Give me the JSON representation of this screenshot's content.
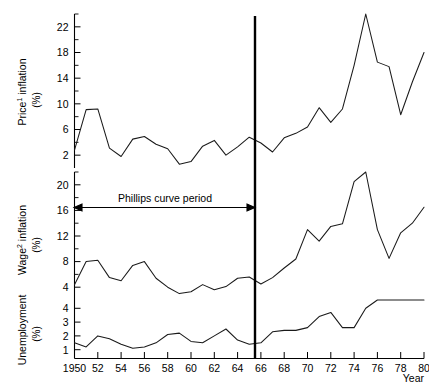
{
  "chart_data": {
    "type": "line",
    "title": "",
    "xlabel": "Year",
    "x": [
      1950,
      1951,
      1952,
      1953,
      1954,
      1955,
      1956,
      1957,
      1958,
      1959,
      1960,
      1961,
      1962,
      1963,
      1964,
      1965,
      1966,
      1967,
      1968,
      1969,
      1970,
      1971,
      1972,
      1973,
      1974,
      1975,
      1976,
      1977,
      1978,
      1979,
      1980
    ],
    "xtick_labels": [
      "1950",
      "52",
      "54",
      "56",
      "58",
      "60",
      "62",
      "64",
      "66",
      "68",
      "70",
      "72",
      "74",
      "76",
      "78",
      "80"
    ],
    "xtick_values": [
      1950,
      1952,
      1954,
      1956,
      1958,
      1960,
      1962,
      1964,
      1966,
      1968,
      1970,
      1972,
      1974,
      1976,
      1978,
      1980
    ],
    "grid": false,
    "legend": "none",
    "annotations": [
      {
        "text": "Phillips curve period",
        "type": "double-arrow-span",
        "x_start": 1950,
        "x_end": 1966,
        "panel": "wage"
      },
      {
        "text": "",
        "type": "vertical-divider",
        "x": 1966,
        "panel": "all"
      }
    ],
    "panels": [
      {
        "key": "price",
        "name": "Price inflation",
        "ylabel": "Price¹ inflation (%)",
        "ylabel_main": "Price",
        "ylabel_sup": "1",
        "ylabel_rest": " inflation",
        "ylabel_unit": "(%)",
        "ylim": [
          0,
          24
        ],
        "yticks": [
          2,
          6,
          10,
          14,
          18,
          22
        ],
        "ytick_minor": [
          4,
          8,
          12,
          16,
          20,
          24
        ],
        "values": [
          2.8,
          9.1,
          9.2,
          3.1,
          1.8,
          4.5,
          4.9,
          3.7,
          3.0,
          0.6,
          1.0,
          3.4,
          4.3,
          2.0,
          3.3,
          4.8,
          3.9,
          2.5,
          4.7,
          5.4,
          6.4,
          9.4,
          7.1,
          9.2,
          16.0,
          24.2,
          16.5,
          15.8,
          8.3,
          13.4,
          18.0
        ]
      },
      {
        "key": "wage",
        "name": "Wage inflation",
        "ylabel": "Wage² inflation (%)",
        "ylabel_main": "Wage",
        "ylabel_sup": "2",
        "ylabel_rest": " inflation",
        "ylabel_unit": "(%)",
        "ylim": [
          2,
          22
        ],
        "yticks": [
          4,
          8,
          12,
          16,
          20
        ],
        "ytick_minor": [
          6,
          10,
          14,
          18,
          22
        ],
        "values": [
          4.4,
          8.0,
          8.2,
          5.5,
          5.0,
          7.4,
          8.0,
          5.4,
          4.0,
          3.0,
          3.3,
          4.4,
          3.6,
          4.1,
          5.4,
          5.6,
          4.5,
          5.5,
          7.0,
          8.4,
          13.0,
          11.2,
          13.5,
          13.9,
          20.5,
          27.0,
          13.0,
          8.5,
          12.5,
          14.0,
          16.5
        ]
      },
      {
        "key": "unemployment",
        "name": "Unemployment",
        "ylabel": "Unemployment (%)",
        "ylabel_main": "Unemployment",
        "ylabel_sup": "",
        "ylabel_rest": "",
        "ylabel_unit": "(%)",
        "ylim": [
          0.4,
          4.6
        ],
        "yticks": [
          1,
          2,
          3,
          4
        ],
        "ytick_minor": [],
        "values": [
          1.5,
          1.2,
          2.0,
          1.8,
          1.4,
          1.1,
          1.2,
          1.5,
          2.1,
          2.2,
          1.6,
          1.5,
          2.0,
          2.5,
          1.7,
          1.4,
          1.5,
          2.3,
          2.4,
          2.4,
          2.6,
          3.4,
          3.7,
          2.6,
          2.6,
          4.0,
          5.3,
          5.7,
          5.6,
          5.3,
          6.4
        ]
      }
    ]
  },
  "labels": {
    "x_axis_title": "Year",
    "annotation_text": "Phillips curve period"
  }
}
